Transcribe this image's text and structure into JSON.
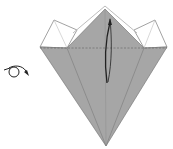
{
  "diagram": {
    "type": "origami-step",
    "colors": {
      "paper_colored": "#a6a6a6",
      "paper_inner": "#9c9c9c",
      "paper_white": "#ffffff",
      "line": "#7a7a7a",
      "arrow": "#222222"
    },
    "symbols": [
      {
        "name": "turn-over-symbol",
        "meaning": "turn model over"
      },
      {
        "name": "fold-arrow",
        "meaning": "fold up along dashed line"
      }
    ]
  }
}
